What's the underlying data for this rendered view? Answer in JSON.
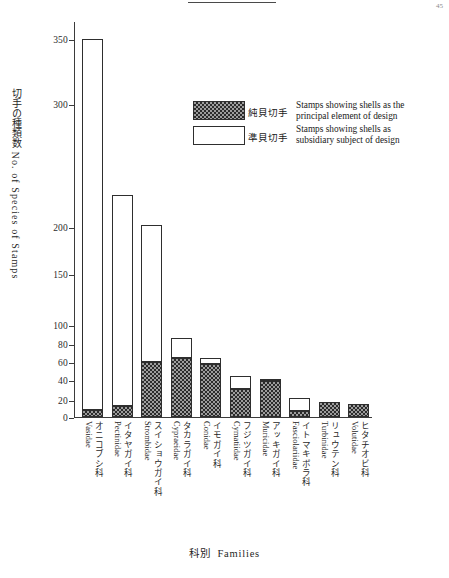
{
  "page": {
    "number": "45"
  },
  "figure": {
    "y_axis_title_jp": "切手の種類数",
    "y_axis_title_en": "No. of Species of Stamps",
    "x_axis_title_jp": "科別",
    "x_axis_title_en": "Families"
  },
  "legend": {
    "items": [
      {
        "swatch": "dark-hatched",
        "label_jp": "純貝切手",
        "label_en_line1": "Stamps showing shells as the",
        "label_en_line2": "principal element of design"
      },
      {
        "swatch": "white-outline",
        "label_jp": "準貝切手",
        "label_en_line1": "Stamps  showing  shells  as",
        "label_en_line2": "subsidiary  subject of design"
      }
    ]
  },
  "chart_data": {
    "type": "bar",
    "stacked": true,
    "title": "",
    "xlabel": "科別  Families",
    "ylabel": "切手の種類数 No. of Species of Stamps",
    "grid": false,
    "legend_position": "upper-right-inside",
    "y_ticks": [
      0,
      20,
      40,
      60,
      80,
      100,
      150,
      200,
      300,
      350
    ],
    "y_axis_note": "non-linear (compressed above 100)",
    "ylim": [
      0,
      360
    ],
    "categories": [
      {
        "sci": "Vasidae",
        "jp": "オニコブシ科"
      },
      {
        "sci": "Pectinidae",
        "jp": "イタヤガイ科"
      },
      {
        "sci": "Strombidae",
        "jp": "スイショウガイ科"
      },
      {
        "sci": "Cypraeidae",
        "jp": "タカラガイ科"
      },
      {
        "sci": "Conidae",
        "jp": "イモガイ科"
      },
      {
        "sci": "Cymatiidae",
        "jp": "フジツガイ科"
      },
      {
        "sci": "Muricidae",
        "jp": "アッキガイ科"
      },
      {
        "sci": "Fasciolariidae",
        "jp": "イトマキボラ科"
      },
      {
        "sci": "Turbinidae",
        "jp": "リュウテン科"
      },
      {
        "sci": "Volutidae",
        "jp": "ヒタチオビ科"
      }
    ],
    "series": [
      {
        "name": "純貝切手 Stamps showing shells as the principal element of design",
        "key": "principal",
        "values": [
          8,
          13,
          60,
          64,
          58,
          31,
          39,
          7,
          18,
          15
        ]
      },
      {
        "name": "準貝切手 Stamps showing shells as subsidiary subject of design",
        "key": "subsidiary",
        "values": [
          345,
          213,
          142,
          22,
          6,
          14,
          2,
          15,
          0,
          0
        ]
      }
    ],
    "totals": [
      353,
      226,
      202,
      86,
      64,
      45,
      41,
      22,
      18,
      15
    ]
  }
}
